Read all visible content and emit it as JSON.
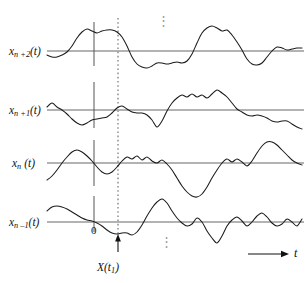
{
  "figure": {
    "background_color": "#ffffff",
    "curve_color": "#1a1a1a",
    "axis_color": "#555555",
    "guide_color": "#888888",
    "width": 307,
    "height": 283
  },
  "labels": {
    "trace_top": {
      "base": "x",
      "sub": "n +2",
      "arg": "(t)"
    },
    "trace_second": {
      "base": "x",
      "sub": "n +1",
      "arg": "(t)"
    },
    "trace_third": {
      "base": "x",
      "sub": "n",
      "arg": " (t)"
    },
    "trace_bottom": {
      "base": "x",
      "sub": "n –1",
      "arg": "(t)"
    },
    "origin": "0",
    "time_axis": "t",
    "sample_value": {
      "base": "X",
      "arg": "(t",
      "sub": "1",
      "close": ")"
    },
    "ellipsis_top": "⋮",
    "ellipsis_bottom": "⋮"
  },
  "chart_data": {
    "type": "line",
    "xlabel": "t",
    "ylabel": "",
    "grid": false,
    "legend": "none",
    "axis_markers": {
      "origin_x": 94,
      "sampling_time_x": 118,
      "sampling_time_label": "t1",
      "time_arrow_y": 254
    },
    "series": [
      {
        "name": "x_{n+2}(t)",
        "baseline_y": 51,
        "x": [
          47,
          52,
          57,
          62,
          67,
          72,
          77,
          82,
          87,
          92,
          97,
          102,
          107,
          112,
          117,
          122,
          127,
          132,
          137,
          142,
          147,
          152,
          157,
          162,
          167,
          172,
          177,
          182,
          187,
          192,
          197,
          202,
          207,
          212,
          217,
          222,
          227,
          232,
          237,
          242,
          247,
          252,
          257,
          262,
          267,
          272,
          277,
          282,
          287,
          292,
          297,
          302
        ],
        "y": [
          55,
          57,
          57,
          55,
          52,
          46,
          38,
          32,
          29,
          31,
          33,
          31,
          30,
          30,
          32,
          37,
          46,
          57,
          64,
          67,
          68,
          66,
          63,
          63,
          64,
          63,
          62,
          63,
          61,
          54,
          43,
          33,
          28,
          26,
          28,
          31,
          30,
          35,
          42,
          50,
          59,
          64,
          65,
          63,
          57,
          51,
          47,
          48,
          50,
          49,
          48,
          48
        ]
      },
      {
        "name": "x_{n+1}(t)",
        "baseline_y": 110,
        "x": [
          47,
          52,
          57,
          62,
          67,
          72,
          77,
          82,
          87,
          92,
          97,
          102,
          107,
          112,
          117,
          122,
          127,
          132,
          137,
          142,
          147,
          152,
          157,
          162,
          167,
          172,
          177,
          182,
          187,
          192,
          197,
          202,
          207,
          212,
          217,
          222,
          227,
          232,
          237,
          242,
          247,
          252,
          257,
          262,
          267,
          272,
          277,
          282,
          287,
          292,
          297,
          302
        ],
        "y": [
          107,
          103,
          107,
          110,
          114,
          119,
          123,
          125,
          123,
          120,
          119,
          118,
          117,
          113,
          108,
          106,
          109,
          112,
          113,
          113,
          115,
          120,
          127,
          121,
          111,
          103,
          98,
          95,
          97,
          94,
          97,
          95,
          98,
          94,
          90,
          93,
          97,
          103,
          109,
          112,
          115,
          116,
          115,
          116,
          118,
          121,
          122,
          121,
          121,
          124,
          127,
          129
        ]
      },
      {
        "name": "x_n(t)",
        "baseline_y": 163,
        "x": [
          47,
          52,
          57,
          62,
          67,
          72,
          77,
          82,
          87,
          92,
          97,
          102,
          107,
          112,
          117,
          122,
          127,
          132,
          137,
          142,
          147,
          152,
          157,
          162,
          167,
          172,
          177,
          182,
          187,
          192,
          197,
          202,
          207,
          212,
          217,
          222,
          227,
          232,
          237,
          242,
          247,
          252,
          257,
          262,
          267,
          272,
          277,
          282,
          287,
          292,
          297,
          302
        ],
        "y": [
          180,
          176,
          170,
          163,
          157,
          152,
          150,
          152,
          156,
          161,
          167,
          172,
          174,
          172,
          167,
          161,
          157,
          159,
          156,
          160,
          157,
          161,
          163,
          160,
          164,
          170,
          178,
          186,
          192,
          196,
          197,
          194,
          187,
          178,
          170,
          163,
          159,
          162,
          159,
          162,
          166,
          161,
          153,
          146,
          142,
          142,
          145,
          150,
          155,
          160,
          163,
          165
        ]
      },
      {
        "name": "x_{n-1}(t)",
        "baseline_y": 222,
        "x": [
          47,
          52,
          57,
          62,
          67,
          72,
          77,
          82,
          87,
          92,
          97,
          102,
          107,
          112,
          117,
          122,
          127,
          132,
          137,
          142,
          147,
          152,
          157,
          162,
          167,
          172,
          177,
          182,
          187,
          192,
          197,
          202,
          207,
          212,
          217,
          222,
          227,
          232,
          237,
          242,
          247,
          252,
          257,
          262,
          267,
          272,
          277,
          282,
          287,
          292,
          297,
          302
        ],
        "y": [
          211,
          207,
          206,
          207,
          209,
          212,
          215,
          218,
          220,
          221,
          223,
          226,
          230,
          233,
          234,
          233,
          233,
          235,
          232,
          225,
          216,
          208,
          202,
          199,
          203,
          211,
          218,
          223,
          226,
          224,
          218,
          222,
          231,
          238,
          243,
          236,
          226,
          220,
          217,
          221,
          226,
          222,
          216,
          213,
          217,
          223,
          226,
          224,
          219,
          222,
          226,
          219
        ]
      }
    ]
  }
}
